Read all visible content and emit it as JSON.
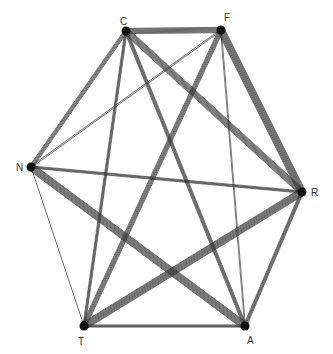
{
  "diagram": {
    "type": "complete-graph-bundled-edges",
    "background": "#ffffff",
    "line_color": "#2a2a2a",
    "nodes": [
      {
        "id": "C",
        "label": "C",
        "x": 126,
        "y": 31,
        "lx": 120,
        "ly": 25
      },
      {
        "id": "F",
        "label": "F",
        "x": 221,
        "y": 30,
        "lx": 224,
        "ly": 21
      },
      {
        "id": "N",
        "label": "N",
        "x": 31,
        "y": 167,
        "lx": 16,
        "ly": 171
      },
      {
        "id": "R",
        "label": "R",
        "x": 302,
        "y": 192,
        "lx": 311,
        "ly": 196
      },
      {
        "id": "T",
        "label": "T",
        "x": 84,
        "y": 326,
        "lx": 78,
        "ly": 345
      },
      {
        "id": "A",
        "label": "A",
        "x": 245,
        "y": 326,
        "lx": 247,
        "ly": 344
      }
    ],
    "edges": [
      {
        "from": "C",
        "to": "F",
        "width": 12,
        "lines": 7
      },
      {
        "from": "C",
        "to": "N",
        "width": 8,
        "lines": 5
      },
      {
        "from": "C",
        "to": "R",
        "width": 14,
        "lines": 9
      },
      {
        "from": "C",
        "to": "T",
        "width": 5,
        "lines": 4
      },
      {
        "from": "C",
        "to": "A",
        "width": 7,
        "lines": 5
      },
      {
        "from": "F",
        "to": "N",
        "width": 3,
        "lines": 2
      },
      {
        "from": "F",
        "to": "R",
        "width": 16,
        "lines": 10
      },
      {
        "from": "F",
        "to": "T",
        "width": 10,
        "lines": 6
      },
      {
        "from": "F",
        "to": "A",
        "width": 2,
        "lines": 2
      },
      {
        "from": "N",
        "to": "R",
        "width": 5,
        "lines": 4
      },
      {
        "from": "N",
        "to": "T",
        "width": 1,
        "lines": 1
      },
      {
        "from": "N",
        "to": "A",
        "width": 16,
        "lines": 10
      },
      {
        "from": "R",
        "to": "T",
        "width": 16,
        "lines": 10
      },
      {
        "from": "R",
        "to": "A",
        "width": 7,
        "lines": 5
      },
      {
        "from": "T",
        "to": "A",
        "width": 5,
        "lines": 4
      }
    ]
  }
}
